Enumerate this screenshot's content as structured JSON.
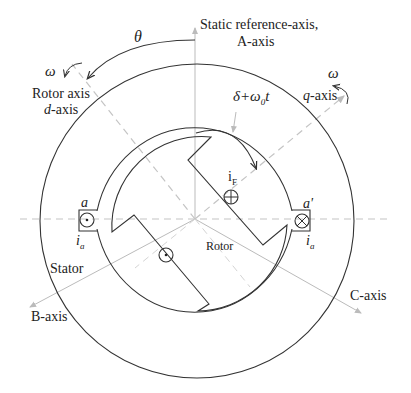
{
  "labels": {
    "static_axis_line1": "Static reference-axis,",
    "static_axis_line2": "A-axis",
    "theta": "θ",
    "omega_left": "ω",
    "omega_right": "ω",
    "rotor_axis": "Rotor axis",
    "d_axis_prefix": "d",
    "d_axis_suffix": "-axis",
    "q_axis_prefix": "q",
    "q_axis_suffix": "-axis",
    "delta_expr": "δ+ω",
    "delta_sub": "0",
    "delta_t": "t",
    "field_current": "i",
    "field_current_sub": "F",
    "coil_a": "a",
    "coil_a_prime": "a'",
    "current_ia_left": "i",
    "current_ia_left_sub": "a",
    "current_ia_right": "i",
    "current_ia_right_sub": "a",
    "stator": "Stator",
    "rotor": "Rotor",
    "b_axis": "B-axis",
    "c_axis": "C-axis"
  },
  "colors": {
    "line": "#333333",
    "axis": "#bbbbbb",
    "dashed": "#c4c4c4",
    "text": "#222222"
  }
}
